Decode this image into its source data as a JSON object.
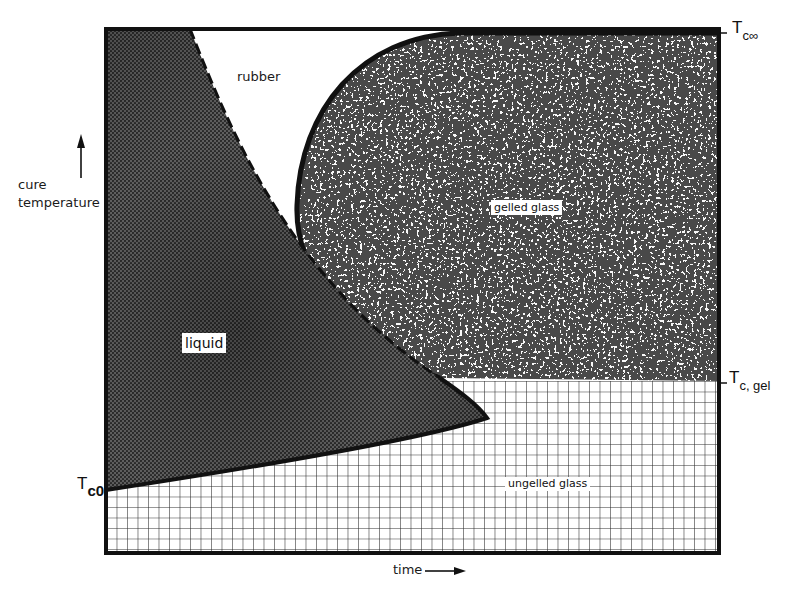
{
  "diagram": {
    "type": "phase diagram (time-temperature-transformation)",
    "axes": {
      "y_label_line1": "cure",
      "y_label_line2": "temperature",
      "x_label": "time",
      "y_arrow": "up-arrow-icon",
      "x_arrow": "right-arrow-icon"
    },
    "temperature_markers": [
      {
        "id": "tc_inf",
        "main": "T",
        "sub": "c∞"
      },
      {
        "id": "tc_gel",
        "main": "T",
        "sub": "c, gel"
      },
      {
        "id": "tc0",
        "main": "T",
        "sub": "c0"
      }
    ],
    "regions": [
      {
        "id": "liquid",
        "label": "liquid",
        "fill": "dark halftone"
      },
      {
        "id": "rubber",
        "label": "rubber",
        "fill": "white"
      },
      {
        "id": "gelled_glass",
        "label": "gelled glass",
        "fill": "black/white speckle"
      },
      {
        "id": "ungelled_glass",
        "label": "ungelled glass",
        "fill": "square grid"
      }
    ],
    "boundaries": [
      {
        "id": "gelation_curve",
        "style": "dashed",
        "between": [
          "liquid",
          "rubber"
        ]
      },
      {
        "id": "vitrification_curve",
        "style": "solid",
        "between": [
          "rubber/liquid",
          "glass"
        ]
      }
    ],
    "colors": {
      "frame": "#111111",
      "liquid": "#4a4a4a",
      "speckle_dark": "#111111",
      "speckle_light": "#f2f2f2",
      "grid_line": "#222222",
      "background": "#ffffff"
    }
  }
}
